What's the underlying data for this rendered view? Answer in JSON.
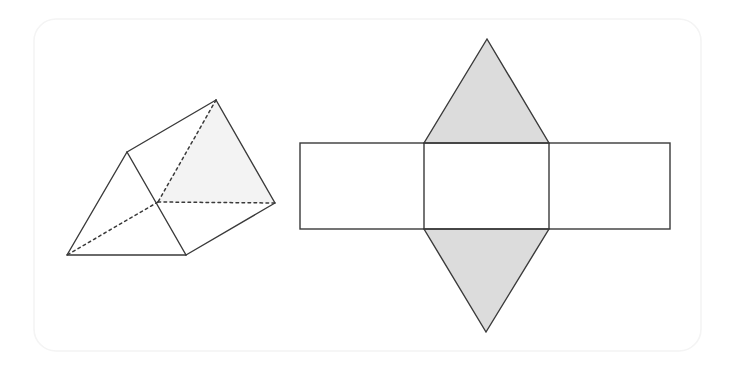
{
  "figure": {
    "background_color": "#ffffff",
    "stroke_color": "#3a3a3a",
    "shade_color": "#dcdcdc",
    "faint_shade_color": "#f3f3f3",
    "border_color": "#f4f4f4",
    "stroke_width": 1.4,
    "panel": {
      "x": 34,
      "y": 19,
      "width": 667,
      "height": 332,
      "radius": 22
    },
    "solid": {
      "label": "triangular-prism-solid",
      "vertices": {
        "front_apex": [
          127,
          152
        ],
        "front_left": [
          67,
          255
        ],
        "front_right": [
          186,
          255
        ],
        "back_apex": [
          216,
          100
        ],
        "back_right": [
          275,
          203
        ],
        "back_hidden": [
          158,
          202
        ]
      },
      "visible_edges": [
        [
          [
            127,
            152
          ],
          [
            67,
            255
          ]
        ],
        [
          [
            67,
            255
          ],
          [
            186,
            255
          ]
        ],
        [
          [
            186,
            255
          ],
          [
            127,
            152
          ]
        ],
        [
          [
            127,
            152
          ],
          [
            216,
            100
          ]
        ],
        [
          [
            216,
            100
          ],
          [
            275,
            203
          ]
        ],
        [
          [
            275,
            203
          ],
          [
            186,
            255
          ]
        ]
      ],
      "hidden_edges": [
        [
          [
            216,
            100
          ],
          [
            158,
            202
          ]
        ],
        [
          [
            158,
            202
          ],
          [
            275,
            203
          ]
        ],
        [
          [
            158,
            202
          ],
          [
            67,
            255
          ]
        ]
      ],
      "shaded_faces": [
        {
          "name": "back-end-face",
          "points": "216,100 275,203 158,202"
        }
      ]
    },
    "net": {
      "label": "triangular-prism-net",
      "rectangle": {
        "left": 300,
        "right": 670,
        "top": 143,
        "bottom": 229
      },
      "center_panel": {
        "left": 424,
        "right": 549
      },
      "top_triangle": {
        "name": "top-shaded-triangle",
        "points": "424,143 549,143 487,39"
      },
      "bottom_triangle": {
        "name": "bottom-shaded-triangle",
        "points": "424,229 549,229 486,332"
      },
      "fold_lines": [
        [
          [
            424,
            143
          ],
          [
            424,
            229
          ]
        ],
        [
          [
            549,
            143
          ],
          [
            549,
            229
          ]
        ]
      ]
    }
  }
}
